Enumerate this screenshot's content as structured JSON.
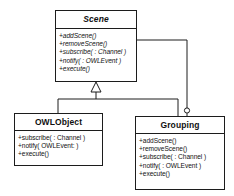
{
  "diagram": {
    "type": "uml-class-diagram",
    "title": "",
    "background_color": "#ffffff",
    "line_color": "#1c1c1c",
    "text_color": "#101010",
    "classes": [
      {
        "id": "scene",
        "name": "Scene",
        "abstract": true,
        "operations": [
          "+addScene()",
          "+removeScene()",
          "+subscribe( : Channel )",
          "+notify( : OWLEvent )",
          "+execute()"
        ]
      },
      {
        "id": "owlobject",
        "name": "OWLObject",
        "abstract": false,
        "operations": [
          "+subscribe( : Channel )",
          "+notify( OWLEvent: )",
          "+execute()"
        ]
      },
      {
        "id": "grouping",
        "name": "Grouping",
        "abstract": false,
        "operations": [
          "+addScene()",
          "+removeScene()",
          "+subscribe( : Channel )",
          "+notify( : OWLEvent )",
          "+execute()"
        ]
      }
    ],
    "relationships": [
      {
        "id": "gen-owlobject",
        "kind": "generalization",
        "from": "OWLObject",
        "to": "Scene",
        "marker": "hollow-triangle"
      },
      {
        "id": "gen-grouping",
        "kind": "generalization",
        "from": "Grouping",
        "to": "Scene",
        "marker": "hollow-triangle"
      },
      {
        "id": "assoc-scene-grouping",
        "kind": "association",
        "from": "Scene",
        "to": "Grouping",
        "marker": "open-circle"
      }
    ]
  }
}
